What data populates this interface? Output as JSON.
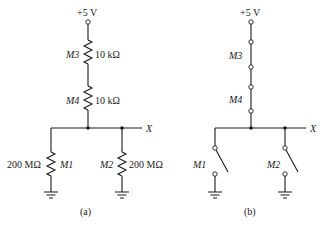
{
  "diagram_a": {
    "caption": "(a)",
    "supply_label": "+5 V",
    "output_label": "X",
    "components": [
      {
        "name": "M3",
        "type": "resistor",
        "value": "10 kΩ"
      },
      {
        "name": "M4",
        "type": "resistor",
        "value": "10 kΩ"
      },
      {
        "name": "M1",
        "type": "resistor",
        "value": "200 MΩ"
      },
      {
        "name": "M2",
        "type": "resistor",
        "value": "200 MΩ"
      }
    ]
  },
  "diagram_b": {
    "caption": "(b)",
    "supply_label": "+5 V",
    "output_label": "X",
    "components": [
      {
        "name": "M3",
        "type": "switch",
        "state": "closed"
      },
      {
        "name": "M4",
        "type": "switch",
        "state": "closed"
      },
      {
        "name": "M1",
        "type": "switch",
        "state": "open"
      },
      {
        "name": "M2",
        "type": "switch",
        "state": "open"
      }
    ]
  },
  "colors": {
    "ink": "#1a1a1a",
    "background": "#ffffff"
  }
}
